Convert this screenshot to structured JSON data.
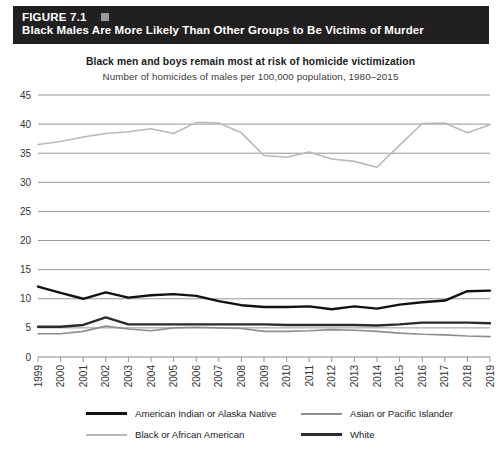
{
  "banner": {
    "figure_label": "FIGURE 7.1",
    "title": "Black Males Are More Likely Than Other Groups to Be Victims of Murder",
    "separator_icon": "square-bullet-icon",
    "background_color": "#221f20",
    "text_color": "#ffffff"
  },
  "chart_data": {
    "type": "line",
    "title": "Black men and boys remain most at risk of homicide victimization",
    "subtitle": "Number of homicides of males per 100,000 population, 1980–2015",
    "xlabel": "",
    "ylabel": "",
    "grid": true,
    "legend_position": "bottom",
    "ylim": [
      0,
      45
    ],
    "yticks": [
      0,
      5,
      10,
      15,
      20,
      25,
      30,
      35,
      40,
      45
    ],
    "categories": [
      "1999",
      "2000",
      "2001",
      "2002",
      "2003",
      "2004",
      "2005",
      "2006",
      "2007",
      "2008",
      "2009",
      "2010",
      "2011",
      "2012",
      "2013",
      "2014",
      "2015",
      "2016",
      "2017",
      "2018",
      "2019"
    ],
    "series": [
      {
        "name": "American Indian or Alaska Native",
        "color": "#111111",
        "width": 2.4,
        "values": [
          12.1,
          11.0,
          10.0,
          11.1,
          10.2,
          10.6,
          10.8,
          10.5,
          9.6,
          8.9,
          8.6,
          8.6,
          8.7,
          8.2,
          8.7,
          8.3,
          9.0,
          9.4,
          9.7,
          11.3,
          11.4
        ]
      },
      {
        "name": "Asian or Pacific Islander",
        "color": "#8e8e8e",
        "width": 1.6,
        "values": [
          4.0,
          4.0,
          4.4,
          5.3,
          4.8,
          4.5,
          5.0,
          5.1,
          5.0,
          4.9,
          4.4,
          4.4,
          4.5,
          4.7,
          4.6,
          4.4,
          4.1,
          3.9,
          3.8,
          3.6,
          3.5
        ]
      },
      {
        "name": "Black or African American",
        "color": "#b9b9b9",
        "width": 1.6,
        "values": [
          36.5,
          37.0,
          37.8,
          38.4,
          38.7,
          39.2,
          38.4,
          40.3,
          40.2,
          38.5,
          34.6,
          34.3,
          35.2,
          34.0,
          33.6,
          32.6,
          36.4,
          40.1,
          40.2,
          38.5,
          39.9
        ]
      },
      {
        "name": "White",
        "color": "#2b2b2b",
        "width": 2.4,
        "values": [
          5.2,
          5.2,
          5.5,
          6.8,
          5.6,
          5.6,
          5.6,
          5.6,
          5.6,
          5.6,
          5.6,
          5.5,
          5.5,
          5.5,
          5.5,
          5.4,
          5.6,
          5.9,
          5.9,
          5.9,
          5.8
        ]
      }
    ]
  }
}
